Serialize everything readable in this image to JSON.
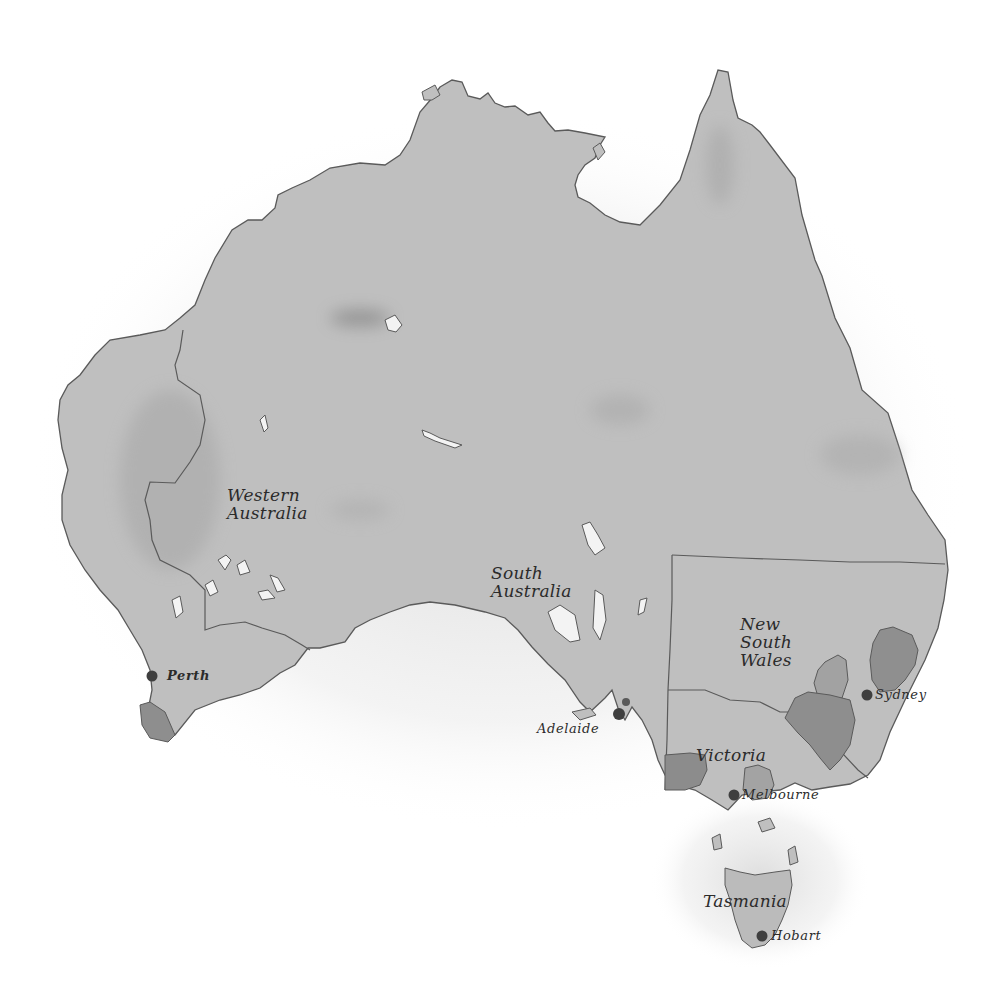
{
  "map": {
    "region": "Australia",
    "style": "watercolor grayscale",
    "colors": {
      "background": "#ffffff",
      "land": "#bdbdbd",
      "land_light": "#c7c7c7",
      "highlight_region": "#8f8f8f",
      "highlight_region_light": "#a4a4a4",
      "outline": "#5a5a5a",
      "city_dot": "#3f3f3f",
      "label_text": "#2b2b2b"
    },
    "states": [
      {
        "name": "Western Australia",
        "label": "Western\nAustralia"
      },
      {
        "name": "South Australia",
        "label": "South\nAustralia"
      },
      {
        "name": "New South Wales",
        "label": "New\nSouth\nWales"
      },
      {
        "name": "Victoria",
        "label": "Victoria"
      },
      {
        "name": "Tasmania",
        "label": "Tasmania"
      }
    ],
    "cities": [
      {
        "name": "Perth",
        "label": "Perth"
      },
      {
        "name": "Adelaide",
        "label": "Adelaide"
      },
      {
        "name": "Sydney",
        "label": "Sydney"
      },
      {
        "name": "Melbourne",
        "label": "Melbourne"
      },
      {
        "name": "Hobart",
        "label": "Hobart"
      }
    ]
  }
}
